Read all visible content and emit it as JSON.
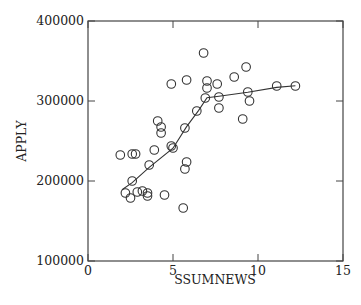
{
  "chart_data": {
    "type": "scatter",
    "title": "",
    "xlabel": "SSUMNEWS",
    "ylabel": "APPLY",
    "xlim": [
      0,
      15
    ],
    "ylim": [
      100000,
      400000
    ],
    "xticks": [
      0,
      5,
      10,
      15
    ],
    "xtick_labels": [
      "0",
      "5",
      "10",
      "15"
    ],
    "yticks": [
      100000,
      200000,
      300000,
      400000
    ],
    "ytick_labels": [
      "100000",
      "200000",
      "300000",
      "400000"
    ],
    "grid": false,
    "legend": null,
    "marker": "open-circle",
    "series": [
      {
        "name": "observations",
        "points": [
          [
            1.9,
            232500
          ],
          [
            2.6,
            233750
          ],
          [
            2.8,
            233750
          ],
          [
            2.6,
            200000
          ],
          [
            2.2,
            185000
          ],
          [
            2.5,
            178750
          ],
          [
            2.9,
            186250
          ],
          [
            3.2,
            187500
          ],
          [
            3.5,
            185000
          ],
          [
            3.5,
            181250
          ],
          [
            3.6,
            220000
          ],
          [
            3.9,
            238750
          ],
          [
            4.1,
            275000
          ],
          [
            4.3,
            267500
          ],
          [
            4.3,
            260000
          ],
          [
            4.5,
            182500
          ],
          [
            4.9,
            243750
          ],
          [
            5.0,
            241250
          ],
          [
            4.9,
            321250
          ],
          [
            5.7,
            266250
          ],
          [
            5.8,
            223750
          ],
          [
            5.7,
            215000
          ],
          [
            5.6,
            166250
          ],
          [
            5.8,
            326250
          ],
          [
            6.4,
            287500
          ],
          [
            6.8,
            360000
          ],
          [
            7.0,
            325000
          ],
          [
            7.0,
            316250
          ],
          [
            6.9,
            303750
          ],
          [
            7.6,
            321250
          ],
          [
            7.7,
            305000
          ],
          [
            7.7,
            291250
          ],
          [
            8.6,
            330000
          ],
          [
            9.3,
            342500
          ],
          [
            9.4,
            311250
          ],
          [
            9.5,
            300000
          ],
          [
            9.1,
            277500
          ],
          [
            11.1,
            318750
          ],
          [
            12.2,
            318750
          ]
        ]
      },
      {
        "name": "smooth-fit",
        "type": "line",
        "points": [
          [
            2.0,
            189000
          ],
          [
            2.6,
            198000
          ],
          [
            3.6,
            217000
          ],
          [
            5.0,
            241000
          ],
          [
            5.8,
            268000
          ],
          [
            6.5,
            288000
          ],
          [
            7.0,
            304000
          ],
          [
            7.7,
            306000
          ],
          [
            9.4,
            311000
          ],
          [
            11.1,
            317000
          ],
          [
            12.2,
            319000
          ]
        ]
      }
    ]
  },
  "colors": {
    "axis": "#444444",
    "marker": "#333333",
    "line": "#333333",
    "background": "#ffffff"
  }
}
